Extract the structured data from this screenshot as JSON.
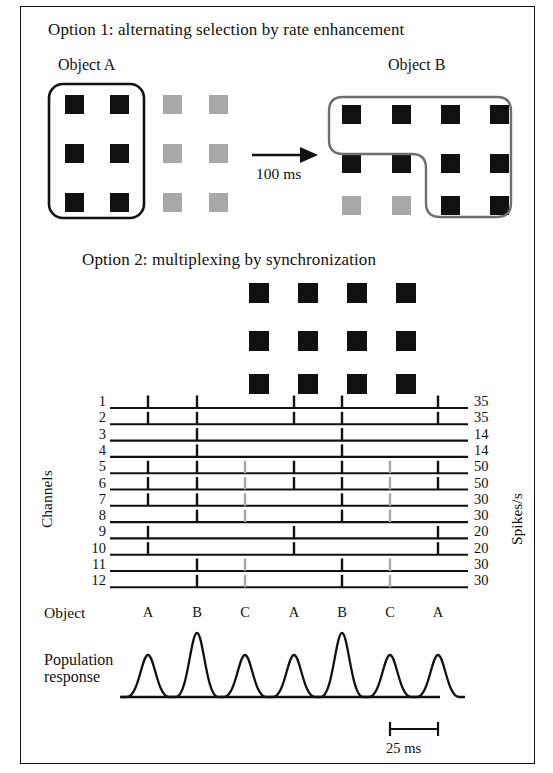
{
  "figure": {
    "border_color": "#111111",
    "black": "#111111",
    "gray": "#a8a8a8"
  },
  "option1": {
    "title": "Option 1: alternating selection by rate enhancement",
    "left_object_label": "Object A",
    "right_object_label": "Object B",
    "arrow_label": "100 ms",
    "left_panel": {
      "rows": 3,
      "cols": 4,
      "cell_colors": [
        [
          "black",
          "black",
          "gray",
          "gray"
        ],
        [
          "black",
          "black",
          "gray",
          "gray"
        ],
        [
          "black",
          "black",
          "gray",
          "gray"
        ]
      ],
      "selection_outline": "columns 1-2, all rows (rounded rectangle)"
    },
    "right_panel": {
      "rows": 3,
      "cols": 4,
      "cell_colors": [
        [
          "black",
          "black",
          "black",
          "black"
        ],
        [
          "black",
          "black",
          "black",
          "black"
        ],
        [
          "gray",
          "gray",
          "black",
          "black"
        ]
      ],
      "selection_outline": "L-shaped rounded path enclosing rows 1-2 all columns plus row 3 columns 3-4"
    }
  },
  "option2": {
    "title": "Option 2: multiplexing by synchronization",
    "grid": {
      "rows": 3,
      "cols": 4,
      "cell_colors": [
        [
          "black",
          "black",
          "black",
          "black"
        ],
        [
          "black",
          "black",
          "black",
          "black"
        ],
        [
          "black",
          "black",
          "black",
          "black"
        ]
      ]
    },
    "axis": {
      "y_label": "Channels",
      "rate_axis_label": "Spikes/s",
      "object_row_label": "Object"
    },
    "channels": [
      {
        "id": "1",
        "rate": "35"
      },
      {
        "id": "2",
        "rate": "35"
      },
      {
        "id": "3",
        "rate": "14"
      },
      {
        "id": "4",
        "rate": "14"
      },
      {
        "id": "5",
        "rate": "50"
      },
      {
        "id": "6",
        "rate": "50"
      },
      {
        "id": "7",
        "rate": "30"
      },
      {
        "id": "8",
        "rate": "30"
      },
      {
        "id": "9",
        "rate": "20"
      },
      {
        "id": "10",
        "rate": "20"
      },
      {
        "id": "11",
        "rate": "30"
      },
      {
        "id": "12",
        "rate": "30"
      }
    ],
    "object_sequence": [
      "A",
      "B",
      "C",
      "A",
      "B",
      "C",
      "A"
    ],
    "spike_raster": {
      "columns": 7,
      "column_objects": [
        "A",
        "B",
        "C",
        "A",
        "B",
        "C",
        "A"
      ],
      "rows": [
        {
          "channel": "1",
          "spikes": [
            "black",
            "black",
            "",
            "black",
            "black",
            "",
            "black"
          ]
        },
        {
          "channel": "2",
          "spikes": [
            "black",
            "black",
            "",
            "black",
            "black",
            "",
            "black"
          ]
        },
        {
          "channel": "3",
          "spikes": [
            "",
            "black",
            "",
            "",
            "black",
            "",
            ""
          ]
        },
        {
          "channel": "4",
          "spikes": [
            "",
            "black",
            "",
            "",
            "black",
            "",
            ""
          ]
        },
        {
          "channel": "5",
          "spikes": [
            "black",
            "black",
            "gray",
            "black",
            "black",
            "gray",
            "black"
          ]
        },
        {
          "channel": "6",
          "spikes": [
            "black",
            "black",
            "gray",
            "black",
            "black",
            "gray",
            "black"
          ]
        },
        {
          "channel": "7",
          "spikes": [
            "black",
            "black",
            "gray",
            "",
            "black",
            "gray",
            ""
          ]
        },
        {
          "channel": "8",
          "spikes": [
            "",
            "black",
            "gray",
            "",
            "black",
            "gray",
            ""
          ]
        },
        {
          "channel": "9",
          "spikes": [
            "black",
            "",
            "",
            "black",
            "",
            "",
            "black"
          ]
        },
        {
          "channel": "10",
          "spikes": [
            "black",
            "",
            "",
            "black",
            "",
            "",
            "black"
          ]
        },
        {
          "channel": "11",
          "spikes": [
            "",
            "black",
            "gray",
            "",
            "black",
            "gray",
            ""
          ]
        },
        {
          "channel": "12",
          "spikes": [
            "",
            "black",
            "gray",
            "",
            "black",
            "gray",
            ""
          ]
        }
      ]
    }
  },
  "population": {
    "label_line1": "Population",
    "label_line2": "response",
    "scale_bar_label": "25 ms",
    "peaks": [
      {
        "object": "A",
        "height": "medium"
      },
      {
        "object": "B",
        "height": "tall"
      },
      {
        "object": "C",
        "height": "medium"
      },
      {
        "object": "A",
        "height": "medium"
      },
      {
        "object": "B",
        "height": "tall"
      },
      {
        "object": "C",
        "height": "medium"
      },
      {
        "object": "A",
        "height": "medium"
      }
    ]
  }
}
